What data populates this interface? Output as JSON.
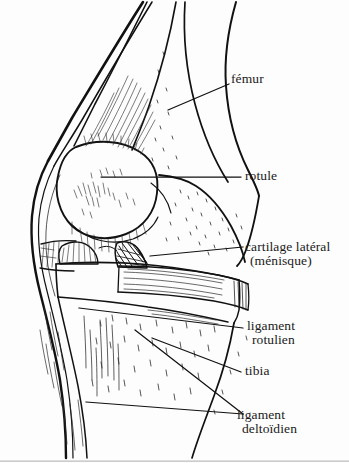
{
  "figure": {
    "style": "line-drawing",
    "ink_color": "#111111",
    "background_color": "#fdfdfd",
    "language": "fr"
  },
  "labels": {
    "femur": {
      "text": "fémur"
    },
    "rotule": {
      "text": "rotule"
    },
    "cartilage": {
      "line1": "cartilage latéral",
      "line2": "(ménisque)"
    },
    "ligament_rotulien": {
      "line1": "ligament",
      "line2": "rotulien"
    },
    "tibia": {
      "text": "tibia"
    },
    "ligament_deltoidien": {
      "line1": "ligament",
      "line2": "deltoïdien"
    }
  },
  "structures": [
    {
      "name": "femur",
      "label": "fémur"
    },
    {
      "name": "patella",
      "label": "rotule"
    },
    {
      "name": "lateral-cartilage-meniscus",
      "label": "cartilage latéral (ménisque)"
    },
    {
      "name": "patellar-ligament",
      "label": "ligament rotulien"
    },
    {
      "name": "tibia",
      "label": "tibia"
    },
    {
      "name": "deltoid-ligament",
      "label": "ligament deltoïdien"
    }
  ]
}
